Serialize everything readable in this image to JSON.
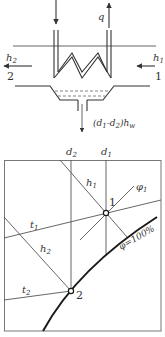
{
  "schematic": {
    "inlet_arrow": "down",
    "outlet_label": "q",
    "left_stream": {
      "enthalpy": "h",
      "enthalpy_sub": "2",
      "state": "2"
    },
    "right_stream": {
      "enthalpy": "h",
      "enthalpy_sub": "1",
      "state": "1"
    },
    "condensate_label": {
      "open": "(",
      "d1": "d",
      "d1_sub": "1",
      "minus": "-",
      "d2": "d",
      "d2_sub": "2",
      "close": ")",
      "h": "h",
      "h_sub": "w"
    }
  },
  "chart": {
    "d2_label": {
      "main": "d",
      "sub": "2"
    },
    "d1_label": {
      "main": "d",
      "sub": "1"
    },
    "h1_label": {
      "main": "h",
      "sub": "1"
    },
    "h2_label": {
      "main": "h",
      "sub": "2"
    },
    "t1_label": {
      "main": "t",
      "sub": "1"
    },
    "t2_label": {
      "main": "t",
      "sub": "2"
    },
    "phi1_label": {
      "main": "φ",
      "sub": "1"
    },
    "saturation_label": "φ=100%",
    "point1_label": "1",
    "point2_label": "2"
  },
  "colors": {
    "line": "#555555",
    "curve": "#1a1a1a",
    "background": "#ffffff"
  }
}
